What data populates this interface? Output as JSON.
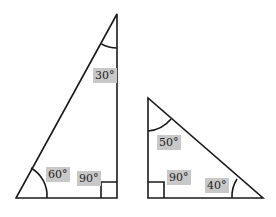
{
  "diagram": {
    "stroke_color": "#1a1a1a",
    "label_background": "#c8c8c8",
    "triangles": [
      {
        "name": "left-triangle",
        "angles": {
          "top": "30°",
          "bottom_left": "60°",
          "right_angle": "90°"
        }
      },
      {
        "name": "right-triangle",
        "angles": {
          "top": "50°",
          "right_angle": "90°",
          "bottom_right": "40°"
        }
      }
    ]
  }
}
